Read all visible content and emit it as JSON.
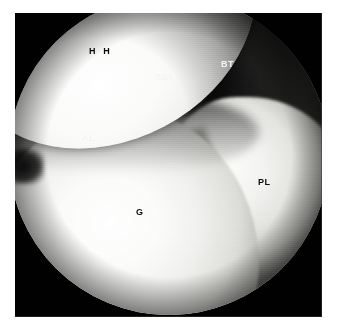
{
  "figure": {
    "kind": "arthroscopic-photograph",
    "view": "shoulder joint arthroscopy",
    "background_color": "#ffffff",
    "plate_color": "#010101"
  },
  "labels": [
    {
      "id": "hh",
      "text": "H H",
      "meaning": "humeral head",
      "color": "#0c0c0c",
      "tone": "dark",
      "spacing": "wide",
      "x": 89,
      "y": 47
    },
    {
      "id": "sgl",
      "text": "SGL",
      "meaning": "superior glenohumeral ligament",
      "color": "#f4f4f4",
      "tone": "light",
      "spacing": "normal",
      "x": 155,
      "y": 73
    },
    {
      "id": "bt",
      "text": "BT",
      "meaning": "biceps tendon",
      "color": "#f4f4f4",
      "tone": "light",
      "spacing": "normal",
      "x": 221,
      "y": 60
    },
    {
      "id": "al",
      "text": "AL",
      "meaning": "anterior labrum",
      "color": "#f4f4f4",
      "tone": "light",
      "spacing": "normal",
      "x": 82,
      "y": 134
    },
    {
      "id": "pl",
      "text": "PL",
      "meaning": "posterior labrum",
      "color": "#0c0c0c",
      "tone": "dark",
      "spacing": "normal",
      "x": 258,
      "y": 178
    },
    {
      "id": "g",
      "text": "G",
      "meaning": "glenoid",
      "color": "#0c0c0c",
      "tone": "dark",
      "spacing": "normal",
      "x": 136,
      "y": 208
    }
  ]
}
